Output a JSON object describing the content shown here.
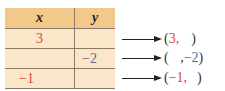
{
  "table": {
    "headers": [
      "x",
      "y"
    ],
    "rows": [
      {
        "x": "3",
        "y": ""
      },
      {
        "x": "",
        "y": "−2"
      },
      {
        "x": "−1",
        "y": ""
      }
    ]
  },
  "pairs": [
    {
      "open": "(",
      "x": "3,",
      "gap": "",
      "y": "",
      "close": ")"
    },
    {
      "open": "(",
      "x": "",
      "gap": " ,",
      "y": "−2",
      "close": ")"
    },
    {
      "open": "(",
      "x": "−1,",
      "gap": "",
      "y": "",
      "close": ")"
    }
  ],
  "colors": {
    "header_bg": "#f2c98a",
    "row_bg": "#fbe6c9",
    "x_color": "#e0433c",
    "y_color": "#3a6fb5"
  }
}
